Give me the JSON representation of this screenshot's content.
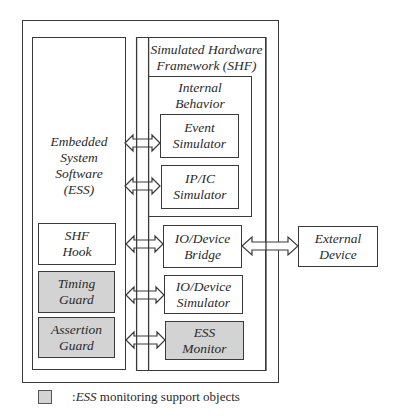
{
  "diagram": {
    "outer_container": {
      "label": ""
    },
    "ess": {
      "title_lines": [
        "Embedded",
        "System",
        "Software",
        "(ESS)"
      ],
      "components": [
        {
          "id": "shf-hook",
          "lines": [
            "SHF",
            "Hook"
          ],
          "shaded": false
        },
        {
          "id": "timing-guard",
          "lines": [
            "Timing",
            "Guard"
          ],
          "shaded": true
        },
        {
          "id": "assertion-guard",
          "lines": [
            "Assertion",
            "Guard"
          ],
          "shaded": true
        }
      ]
    },
    "shf": {
      "title_lines": [
        "Simulated Hardware",
        "Framework (SHF)"
      ],
      "internal_behavior": {
        "title_lines": [
          "Internal",
          "Behavior"
        ],
        "components": [
          {
            "id": "event-simulator",
            "lines": [
              "Event",
              "Simulator"
            ],
            "shaded": false
          },
          {
            "id": "ip-ic-simulator",
            "lines": [
              "IP/IC",
              "Simulator"
            ],
            "shaded": false
          }
        ]
      },
      "components": [
        {
          "id": "io-device-bridge",
          "lines": [
            "IO/Device",
            "Bridge"
          ],
          "shaded": false
        },
        {
          "id": "io-device-simulator",
          "lines": [
            "IO/Device",
            "Simulator"
          ],
          "shaded": false
        },
        {
          "id": "ess-monitor",
          "lines": [
            "ESS",
            "Monitor"
          ],
          "shaded": true
        }
      ]
    },
    "external": {
      "id": "external-device",
      "lines": [
        "External",
        "Device"
      ]
    },
    "connections": [
      {
        "from": "ess-bus",
        "to": "event-simulator",
        "type": "bidirectional"
      },
      {
        "from": "ess-bus",
        "to": "ip-ic-simulator",
        "type": "bidirectional"
      },
      {
        "from": "shf-hook",
        "to": "io-device-bridge",
        "type": "bidirectional"
      },
      {
        "from": "timing-guard",
        "to": "io-device-simulator",
        "type": "bidirectional"
      },
      {
        "from": "assertion-guard",
        "to": "ess-monitor",
        "type": "bidirectional"
      },
      {
        "from": "io-device-bridge",
        "to": "external-device",
        "type": "bidirectional"
      }
    ],
    "colors": {
      "shaded_fill": "#d3d3d3",
      "stroke": "#3a3a3a"
    },
    "legend": {
      "prefix": ":",
      "emphasis": "ESS",
      "text": " monitoring support objects"
    }
  }
}
